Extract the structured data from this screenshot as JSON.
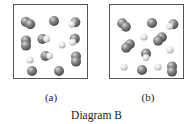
{
  "figure": {
    "caption": "Diagram B",
    "colors": {
      "large_atom": "#7a7a7a",
      "small_atom": "#e6e6e6",
      "border": "#555555"
    },
    "panels": [
      {
        "label": "(a)",
        "molecules": [
          {
            "type": "diatomic-dark",
            "x": 14,
            "y": 18,
            "angle": 30
          },
          {
            "type": "single-dark",
            "x": 40,
            "y": 16
          },
          {
            "type": "diatomic-dark-light",
            "x": 60,
            "y": 18,
            "angle": 150
          },
          {
            "type": "diatomic-dark",
            "x": 12,
            "y": 38,
            "angle": 90
          },
          {
            "type": "diatomic-dark-light",
            "x": 30,
            "y": 34,
            "angle": 0
          },
          {
            "type": "single-light",
            "x": 48,
            "y": 40
          },
          {
            "type": "diatomic-dark-light",
            "x": 60,
            "y": 35,
            "angle": 120
          },
          {
            "type": "single-light",
            "x": 16,
            "y": 55
          },
          {
            "type": "diatomic-dark-light",
            "x": 33,
            "y": 51,
            "angle": 0
          },
          {
            "type": "diatomic-dark",
            "x": 62,
            "y": 54,
            "angle": 90
          },
          {
            "type": "single-dark",
            "x": 18,
            "y": 66
          },
          {
            "type": "single-dark",
            "x": 45,
            "y": 66
          }
        ]
      },
      {
        "label": "(b)",
        "molecules": [
          {
            "type": "diatomic-dark",
            "x": 14,
            "y": 20,
            "angle": 45
          },
          {
            "type": "single-dark",
            "x": 42,
            "y": 18
          },
          {
            "type": "diatomic-dark-light",
            "x": 62,
            "y": 20,
            "angle": 150
          },
          {
            "type": "single-light",
            "x": 34,
            "y": 32
          },
          {
            "type": "diatomic-dark",
            "x": 50,
            "y": 34,
            "angle": 135
          },
          {
            "type": "diatomic-dark",
            "x": 18,
            "y": 41,
            "angle": 135
          },
          {
            "type": "single-light",
            "x": 60,
            "y": 45
          },
          {
            "type": "diatomic-dark-light",
            "x": 36,
            "y": 50,
            "angle": 90
          },
          {
            "type": "single-light",
            "x": 14,
            "y": 62
          },
          {
            "type": "single-dark",
            "x": 32,
            "y": 65
          },
          {
            "type": "single-light",
            "x": 48,
            "y": 62
          },
          {
            "type": "diatomic-dark",
            "x": 62,
            "y": 64,
            "angle": 90
          }
        ]
      }
    ]
  }
}
